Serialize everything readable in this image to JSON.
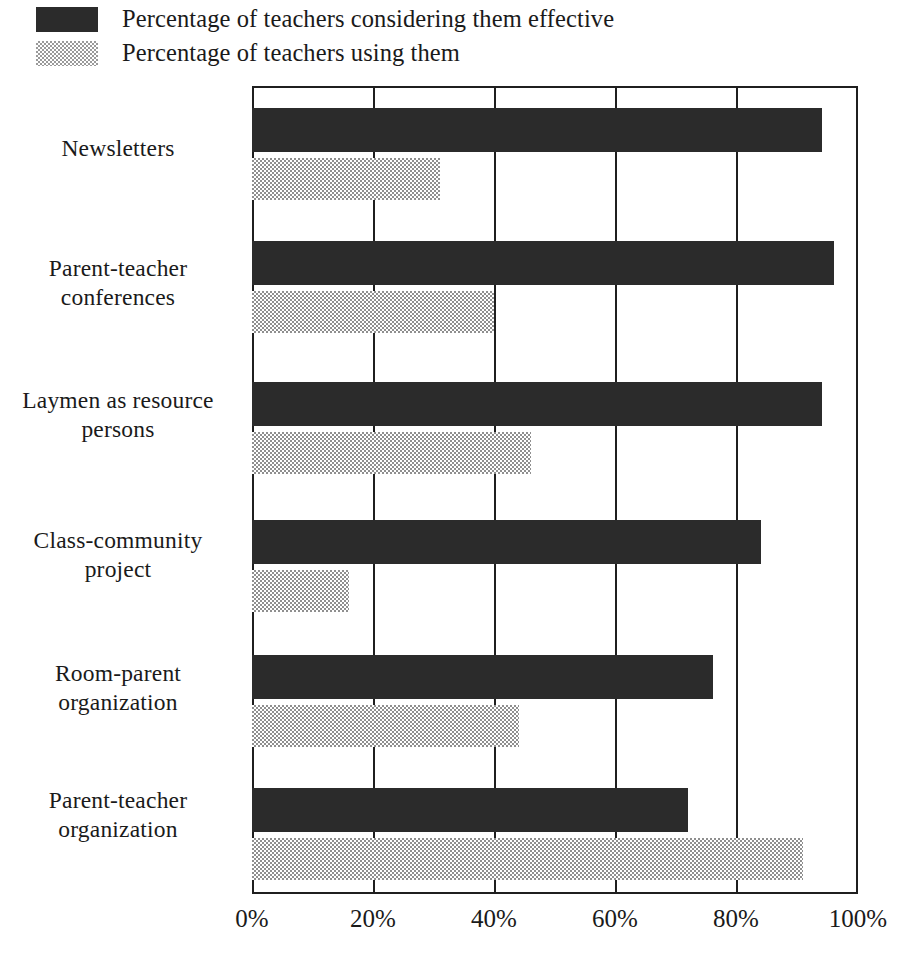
{
  "legend": {
    "items": [
      {
        "label": "Percentage of teachers considering them effective",
        "swatch": "dark-solid-swatch",
        "color": "#2b2b2b"
      },
      {
        "label": "Percentage of teachers using them",
        "swatch": "light-checkered-swatch",
        "color": "#9a9a9a"
      }
    ]
  },
  "axis": {
    "ticks": [
      "0%",
      "20%",
      "40%",
      "60%",
      "80%",
      "100%"
    ],
    "tick_values": [
      0,
      20,
      40,
      60,
      80,
      100
    ]
  },
  "categories": [
    {
      "line1": "Newsletters",
      "line2": ""
    },
    {
      "line1": "Parent-teacher",
      "line2": "conferences"
    },
    {
      "line1": "Laymen as resource",
      "line2": "persons"
    },
    {
      "line1": "Class-community",
      "line2": "project"
    },
    {
      "line1": "Room-parent",
      "line2": "organization"
    },
    {
      "line1": "Parent-teacher",
      "line2": "organization"
    }
  ],
  "chart_data": {
    "type": "bar",
    "orientation": "horizontal",
    "title": "",
    "xlabel": "",
    "ylabel": "",
    "xlim": [
      0,
      100
    ],
    "xticks": [
      0,
      20,
      40,
      60,
      80,
      100
    ],
    "xticklabels": [
      "0%",
      "20%",
      "40%",
      "60%",
      "80%",
      "100%"
    ],
    "grid": true,
    "grid_axis": "x",
    "legend_position": "top-left-outside",
    "categories": [
      "Newsletters",
      "Parent-teacher conferences",
      "Laymen as resource persons",
      "Class-community project",
      "Room-parent organization",
      "Parent-teacher organization"
    ],
    "series": [
      {
        "name": "Percentage of teachers considering them effective",
        "color": "#2b2b2b",
        "values": [
          94,
          96,
          94,
          84,
          76,
          72
        ]
      },
      {
        "name": "Percentage of teachers using them",
        "color": "#9a9a9a",
        "values": [
          31,
          40,
          46,
          16,
          44,
          91
        ]
      }
    ]
  }
}
